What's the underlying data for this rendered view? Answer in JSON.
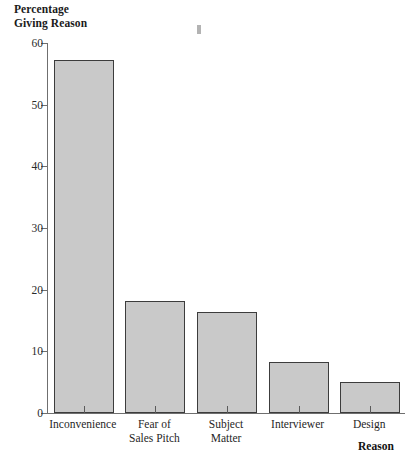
{
  "chart_data": {
    "type": "bar",
    "title": "",
    "ylabel": "Percentage\nGiving Reason",
    "xlabel": "Reason",
    "categories": [
      "Inconvenience",
      "Fear of\nSales Pitch",
      "Subject\nMatter",
      "Interviewer",
      "Design"
    ],
    "values": [
      57.3,
      18.2,
      16.3,
      8.2,
      5.0
    ],
    "ylim": [
      0,
      60
    ],
    "yticks": [
      0,
      10,
      20,
      30,
      40,
      50,
      60
    ],
    "ytick_labels": [
      "0",
      "10",
      "20",
      "30",
      "40",
      "50",
      "60"
    ],
    "grid": false,
    "legend": null,
    "bar_fill_color": "#c9c9c9",
    "bar_edge_color": "#3c3c3c",
    "axis_color": "#6f6f6f"
  },
  "axes": {
    "y_title_line1": "Percentage",
    "y_title_line2": "Giving Reason",
    "x_title": "Reason"
  }
}
